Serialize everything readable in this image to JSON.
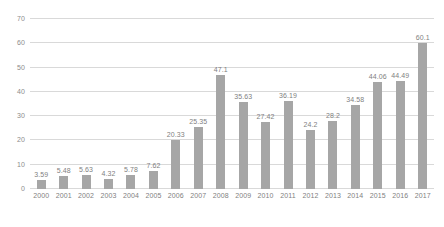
{
  "chart_data": {
    "type": "bar",
    "title": "",
    "subtitle": "",
    "xlabel": "",
    "ylabel": "",
    "categories": [
      "2000",
      "2001",
      "2002",
      "2003",
      "2004",
      "2005",
      "2006",
      "2007",
      "2008",
      "2009",
      "2010",
      "2011",
      "2012",
      "2013",
      "2014",
      "2015",
      "2016",
      "2017"
    ],
    "values": [
      3.59,
      5.48,
      5.63,
      4.32,
      5.78,
      7.62,
      20.33,
      25.35,
      47.1,
      35.63,
      27.42,
      36.19,
      24.2,
      28.2,
      34.58,
      44.06,
      44.49,
      60.1
    ],
    "value_labels": [
      "3.59",
      "5.48",
      "5.63",
      "4.32",
      "5.78",
      "7.62",
      "20.33",
      "25.35",
      "47.1",
      "35.63",
      "27.42",
      "36.19",
      "24.2",
      "28.2",
      "34.58",
      "44.06",
      "44.49",
      "60.1"
    ],
    "ylim": [
      0,
      70
    ],
    "yticks": [
      0,
      10,
      20,
      30,
      40,
      50,
      60,
      70
    ],
    "ytick_labels": [
      "0",
      "10",
      "20",
      "30",
      "40",
      "50",
      "60",
      "70"
    ],
    "grid": true,
    "legend": false,
    "legend_position": "none",
    "series": [
      {
        "name": "",
        "values": [
          3.59,
          5.48,
          5.63,
          4.32,
          5.78,
          7.62,
          20.33,
          25.35,
          47.1,
          35.63,
          27.42,
          36.19,
          24.2,
          28.2,
          34.58,
          44.06,
          44.49,
          60.1
        ],
        "color": "#a6a6a6"
      }
    ],
    "colors": {
      "bar": "#a6a6a6",
      "grid": "#d9d9d9",
      "tick_text": "#7f7f7f",
      "label_text": "#7f7f7f",
      "background": "#ffffff"
    },
    "data_labels_shown": true
  }
}
